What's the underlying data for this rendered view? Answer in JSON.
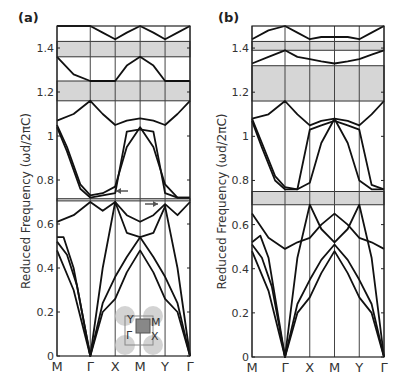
{
  "chart_data": [
    {
      "type": "line",
      "panel_label": "(a)",
      "ylabel": "Reduced Frequency (ωd/2πC)",
      "xlabel": "",
      "x_ticks": [
        "M",
        "Γ",
        "X",
        "M",
        "Y",
        "Γ"
      ],
      "x_tick_positions": [
        0,
        1,
        1.75,
        2.5,
        3.25,
        4
      ],
      "y_ticks": [
        "0",
        "0.2",
        "0.4",
        "0.6",
        "0.8",
        "1",
        "1.2",
        "1.4"
      ],
      "ylim": [
        0,
        1.5
      ],
      "grid": "vertical lines at high-symmetry points",
      "band_gaps": [
        [
          1.36,
          1.43
        ],
        [
          1.16,
          1.25
        ],
        [
          0.705,
          0.715
        ]
      ],
      "annotations": [
        "left arrow near X at ~0.75",
        "right arrow near Y at ~0.69",
        "inset: Brillouin zone with Γ, X, M, Y"
      ],
      "inset_labels": [
        "Y",
        "M",
        "Γ",
        "X"
      ],
      "series": [
        {
          "name": "band1",
          "x": [
            0,
            0.5,
            1,
            1.375,
            1.75,
            2.1,
            2.5,
            2.9,
            3.25,
            3.625,
            4
          ],
          "values": [
            0.48,
            0.3,
            0,
            0.2,
            0.26,
            0.38,
            0.48,
            0.38,
            0.26,
            0.2,
            0
          ]
        },
        {
          "name": "band2",
          "x": [
            0,
            0.3,
            0.6,
            1,
            1.375,
            1.75,
            2.1,
            2.5,
            2.9,
            3.25,
            3.625,
            4
          ],
          "values": [
            0.52,
            0.46,
            0.32,
            0,
            0.24,
            0.36,
            0.45,
            0.54,
            0.45,
            0.36,
            0.24,
            0
          ]
        },
        {
          "name": "band3",
          "x": [
            0,
            0.2,
            0.5,
            1,
            1.375,
            1.75,
            2.1,
            2.5,
            2.9,
            3.25,
            3.625,
            4
          ],
          "values": [
            0.54,
            0.54,
            0.4,
            0,
            0.4,
            0.7,
            0.56,
            0.54,
            0.56,
            0.68,
            0.4,
            0
          ]
        },
        {
          "name": "band4",
          "x": [
            0,
            0.5,
            1,
            1.375,
            1.75,
            2.1,
            2.5,
            2.9,
            3.25,
            3.625,
            4
          ],
          "values": [
            0.61,
            0.64,
            0.7,
            0.66,
            0.7,
            0.64,
            0.61,
            0.64,
            0.69,
            0.64,
            0.7
          ]
        },
        {
          "name": "band5",
          "x": [
            0,
            0.3,
            0.7,
            1,
            1.375,
            1.75,
            2.1,
            2.5,
            2.9,
            3.25,
            3.625,
            4
          ],
          "values": [
            1.05,
            0.95,
            0.78,
            0.73,
            0.74,
            0.77,
            0.95,
            1.04,
            0.95,
            0.78,
            0.72,
            0.72
          ]
        },
        {
          "name": "band6",
          "x": [
            0,
            0.3,
            0.7,
            1,
            1.375,
            1.75,
            2.1,
            2.5,
            2.9,
            3.25,
            3.625,
            4
          ],
          "values": [
            1.04,
            0.93,
            0.76,
            0.72,
            0.73,
            0.74,
            1.02,
            1.03,
            1.02,
            0.74,
            0.72,
            0.72
          ]
        },
        {
          "name": "band7",
          "x": [
            0,
            0.5,
            1,
            1.375,
            1.75,
            2.1,
            2.5,
            2.9,
            3.25,
            3.625,
            4
          ],
          "values": [
            1.07,
            1.1,
            1.16,
            1.1,
            1.05,
            1.07,
            1.08,
            1.07,
            1.05,
            1.1,
            1.16
          ]
        },
        {
          "name": "band8",
          "x": [
            0,
            0.5,
            1,
            1.375,
            1.75,
            2.1,
            2.5,
            2.9,
            3.25,
            3.625,
            4
          ],
          "values": [
            1.36,
            1.28,
            1.25,
            1.25,
            1.25,
            1.32,
            1.36,
            1.32,
            1.25,
            1.25,
            1.25
          ]
        },
        {
          "name": "band9",
          "x": [
            0,
            0.5,
            1,
            1.375,
            1.75,
            2.1,
            2.5,
            2.9,
            3.25,
            3.625,
            4
          ],
          "values": [
            1.5,
            1.5,
            1.5,
            1.47,
            1.44,
            1.47,
            1.5,
            1.47,
            1.44,
            1.47,
            1.5
          ]
        }
      ]
    },
    {
      "type": "line",
      "panel_label": "(b)",
      "ylabel": "Reduced Frequency (ωd/2πC)",
      "xlabel": "",
      "x_ticks": [
        "M",
        "Γ",
        "X",
        "M",
        "Y",
        "Γ"
      ],
      "x_tick_positions": [
        0,
        1,
        1.75,
        2.5,
        3.25,
        4
      ],
      "y_ticks": [
        "0",
        "0.2",
        "0.4",
        "0.6",
        "0.8",
        "1",
        "1.2",
        "1.4"
      ],
      "ylim": [
        0,
        1.5
      ],
      "grid": "vertical lines at high-symmetry points",
      "band_gaps": [
        [
          1.39,
          1.43
        ],
        [
          1.16,
          1.32
        ],
        [
          0.69,
          0.75
        ]
      ],
      "series": [
        {
          "name": "band1",
          "x": [
            0,
            0.5,
            1,
            1.375,
            1.75,
            2.1,
            2.5,
            2.9,
            3.25,
            3.625,
            4
          ],
          "values": [
            0.48,
            0.3,
            0,
            0.2,
            0.27,
            0.38,
            0.48,
            0.38,
            0.27,
            0.2,
            0
          ]
        },
        {
          "name": "band2",
          "x": [
            0,
            0.3,
            0.6,
            1,
            1.375,
            1.75,
            2.1,
            2.5,
            2.9,
            3.25,
            3.625,
            4
          ],
          "values": [
            0.51,
            0.45,
            0.32,
            0,
            0.24,
            0.35,
            0.44,
            0.51,
            0.44,
            0.35,
            0.24,
            0
          ]
        },
        {
          "name": "band3",
          "x": [
            0,
            0.25,
            0.5,
            1,
            1.375,
            1.75,
            2.1,
            2.5,
            2.9,
            3.25,
            3.625,
            4
          ],
          "values": [
            0.52,
            0.55,
            0.45,
            0,
            0.45,
            0.69,
            0.58,
            0.52,
            0.58,
            0.69,
            0.45,
            0
          ]
        },
        {
          "name": "band4",
          "x": [
            0,
            0.5,
            1,
            1.375,
            1.75,
            2.1,
            2.5,
            2.9,
            3.25,
            3.625,
            4
          ],
          "values": [
            0.65,
            0.54,
            0.49,
            0.52,
            0.54,
            0.6,
            0.65,
            0.6,
            0.54,
            0.52,
            0.49
          ]
        },
        {
          "name": "band5",
          "x": [
            0,
            0.3,
            0.7,
            1,
            1.375,
            1.75,
            2.1,
            2.5,
            2.9,
            3.25,
            3.625,
            4
          ],
          "values": [
            1.08,
            0.97,
            0.82,
            0.77,
            0.76,
            0.79,
            0.97,
            1.08,
            0.97,
            0.8,
            0.76,
            0.76
          ]
        },
        {
          "name": "band6",
          "x": [
            0,
            0.3,
            0.7,
            1,
            1.375,
            1.75,
            2.1,
            2.5,
            2.9,
            3.25,
            3.625,
            4
          ],
          "values": [
            1.07,
            0.95,
            0.8,
            0.76,
            0.76,
            1.03,
            1.05,
            1.07,
            1.05,
            1.03,
            0.78,
            0.76
          ]
        },
        {
          "name": "band7",
          "x": [
            0,
            0.5,
            1,
            1.375,
            1.75,
            2.1,
            2.5,
            2.9,
            3.25,
            3.625,
            4
          ],
          "values": [
            1.08,
            1.1,
            1.16,
            1.1,
            1.05,
            1.07,
            1.08,
            1.07,
            1.05,
            1.1,
            1.16
          ]
        },
        {
          "name": "band8",
          "x": [
            0,
            0.5,
            1,
            1.375,
            1.75,
            2.1,
            2.5,
            2.9,
            3.25,
            3.625,
            4
          ],
          "values": [
            1.33,
            1.36,
            1.39,
            1.36,
            1.35,
            1.34,
            1.33,
            1.34,
            1.35,
            1.37,
            1.39
          ]
        },
        {
          "name": "band9",
          "x": [
            0,
            0.5,
            1,
            1.375,
            1.75,
            2.1,
            2.5,
            2.9,
            3.25,
            3.625,
            4
          ],
          "values": [
            1.44,
            1.48,
            1.5,
            1.47,
            1.44,
            1.45,
            1.45,
            1.45,
            1.44,
            1.47,
            1.5
          ]
        }
      ]
    }
  ]
}
